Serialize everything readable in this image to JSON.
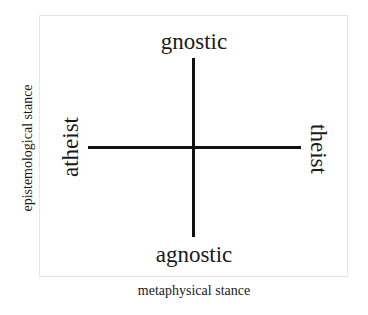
{
  "diagram": {
    "type": "quadrant-axes",
    "axes": {
      "horizontal": {
        "label": "metaphysical stance",
        "left_end": "atheist",
        "right_end": "theist"
      },
      "vertical": {
        "label": "epistemological stance",
        "top_end": "gnostic",
        "bottom_end": "agnostic"
      }
    },
    "colors": {
      "line": "#111111",
      "text": "#1a1a1a",
      "frame": "#e6e6e6",
      "background": "#ffffff"
    }
  }
}
